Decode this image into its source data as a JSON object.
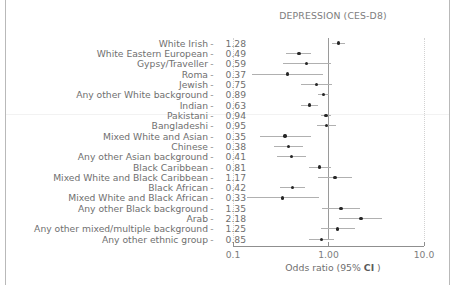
{
  "chart_data": {
    "type": "scatter",
    "plot_kind": "forest-plot",
    "title": "DEPRESSION (CES-D8)",
    "xlabel_prefix": "Odds ratio (95% ",
    "xlabel_bold": "CI",
    "xlabel_suffix": " )",
    "xlabel": "Odds ratio (95% CI )",
    "ylabel": "",
    "xscale": "log",
    "xlim": [
      0.1,
      10.0
    ],
    "xticks": [
      0.1,
      1.0,
      10.0
    ],
    "xtick_labels": [
      "0.1",
      "1.00",
      "10.0"
    ],
    "grid": "vertical-dotted-at-limits",
    "reference_line": 1.0,
    "legend": "none",
    "value_column_header": "",
    "categories": [
      "White Irish",
      "White Eastern European",
      "Gypsy/Traveller",
      "Roma",
      "Jewish",
      "Any other White background",
      "Indian",
      "Pakistani",
      "Bangladeshi",
      "Mixed White and Asian",
      "Chinese",
      "Any other Asian background",
      "Black Caribbean",
      "Mixed White and Black Caribbean",
      "Black African",
      "Mixed White and Black African",
      "Any other Black background",
      "Arab",
      "Any other mixed/multiple background",
      "Any other ethnic group"
    ],
    "values": [
      1.28,
      0.49,
      0.59,
      0.37,
      0.75,
      0.89,
      0.63,
      0.94,
      0.95,
      0.35,
      0.38,
      0.41,
      0.81,
      1.17,
      0.42,
      0.33,
      1.35,
      2.18,
      1.25,
      0.85
    ],
    "value_labels": [
      "1.28",
      "0.49",
      "0.59",
      "0.37",
      "0.75",
      "0.89",
      "0.63",
      "0.94",
      "0.95",
      "0.35",
      "0.38",
      "0.41",
      "0.81",
      "1.17",
      "0.42",
      "0.33",
      "1.35",
      "2.18",
      "1.25",
      "0.85"
    ],
    "ci_low": [
      1.1,
      0.36,
      0.33,
      0.16,
      0.52,
      0.78,
      0.52,
      0.83,
      0.75,
      0.19,
      0.27,
      0.29,
      0.62,
      0.78,
      0.31,
      0.14,
      0.86,
      1.3,
      0.83,
      0.63
    ],
    "ci_high": [
      1.5,
      0.66,
      1.05,
      0.88,
      1.09,
      1.02,
      0.77,
      1.07,
      1.21,
      0.66,
      0.54,
      0.58,
      1.06,
      1.76,
      0.57,
      0.8,
      2.12,
      3.66,
      1.89,
      1.15
    ],
    "separator_glyph": "-",
    "colors": {
      "marker": "#262626",
      "ci": "#b0b0b0",
      "reference_line": "#9a9a9a",
      "gridline": "#d2d2d2",
      "text": "#6f6f6f",
      "axis": "#8f8f8f",
      "background": "#ffffff"
    }
  }
}
